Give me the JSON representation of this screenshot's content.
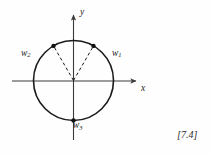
{
  "figure": {
    "reference_tag": "[7.4]",
    "axes": {
      "x_label": "x",
      "y_label": "y",
      "x_axis_name": "horizontal-axis",
      "y_axis_name": "vertical-axis"
    },
    "circle": {
      "center_x": 73.5,
      "center_y": 80.5,
      "radius": 40,
      "stroke": "#1a1a1a",
      "fill": "none"
    },
    "points": [
      {
        "id": "w1",
        "label": "w",
        "subscript": "1",
        "angle_deg": 60,
        "x": 93.5,
        "y": 45.9,
        "marker": "filled-dot"
      },
      {
        "id": "w2",
        "label": "w",
        "subscript": "2",
        "angle_deg": 120,
        "x": 53.5,
        "y": 45.9,
        "marker": "filled-dot"
      },
      {
        "id": "w3",
        "label": "w",
        "subscript": "3",
        "angle_deg": 270,
        "x": 73.5,
        "y": 120.5,
        "marker": "filled-dot"
      }
    ],
    "radii_lines": [
      {
        "id": "radius-to-w1",
        "style": "dashed"
      },
      {
        "id": "radius-to-w2",
        "style": "dashed"
      }
    ],
    "colors": {
      "ink": "#1a1a1a",
      "axis": "#3a3a3a",
      "background": "#fefefe"
    }
  }
}
